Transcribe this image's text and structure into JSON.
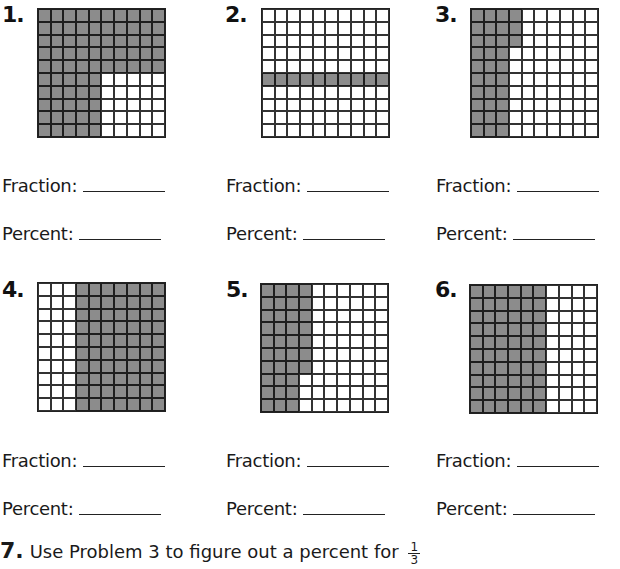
{
  "problems": [
    {
      "number": "1.",
      "fraction_label": "Fraction:",
      "percent_label": "Percent:",
      "fraction_value": "",
      "percent_value": "",
      "grid": {
        "rows": 10,
        "cols": 10,
        "shaded_count": 75,
        "description": "top 5 rows fully shaded; bottom 5 rows: left 5 columns shaded"
      }
    },
    {
      "number": "2.",
      "fraction_label": "Fraction:",
      "percent_label": "Percent:",
      "fraction_value": "",
      "percent_value": "",
      "grid": {
        "rows": 10,
        "cols": 10,
        "shaded_count": 10,
        "description": "row 6 fully shaded"
      }
    },
    {
      "number": "3.",
      "fraction_label": "Fraction:",
      "percent_label": "Percent:",
      "fraction_value": "",
      "percent_value": "",
      "grid": {
        "rows": 10,
        "cols": 10,
        "shaded_count": 33,
        "description": "columns 1-3 fully shaded; column 4 rows 1-3 shaded"
      }
    },
    {
      "number": "4.",
      "fraction_label": "Fraction:",
      "percent_label": "Percent:",
      "fraction_value": "",
      "percent_value": "",
      "grid": {
        "rows": 10,
        "cols": 10,
        "shaded_count": 70,
        "description": "columns 4-10 fully shaded"
      }
    },
    {
      "number": "5.",
      "fraction_label": "Fraction:",
      "percent_label": "Percent:",
      "fraction_value": "",
      "percent_value": "",
      "grid": {
        "rows": 10,
        "cols": 10,
        "shaded_count": 37,
        "description": "columns 1-3 fully shaded; column 4 rows 1-7 shaded"
      }
    },
    {
      "number": "6.",
      "fraction_label": "Fraction:",
      "percent_label": "Percent:",
      "fraction_value": "",
      "percent_value": "",
      "grid": {
        "rows": 10,
        "cols": 10,
        "shaded_count": 60,
        "description": "columns 1-6 fully shaded"
      }
    }
  ],
  "question7": {
    "number": "7.",
    "text": "Use Problem 3 to figure out a percent for",
    "fraction_numerator": "1",
    "fraction_denominator": "3"
  },
  "colors": {
    "shaded": "#8c8c8c",
    "gridline": "#222222",
    "background": "#ffffff"
  }
}
